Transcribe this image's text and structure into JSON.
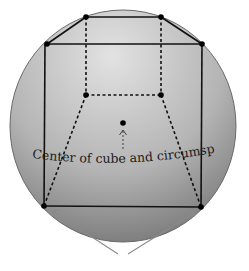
{
  "figure": {
    "label": "Center of cube and circumsphere",
    "colors": {
      "background": "#ffffff",
      "sphere_light": "#dcdcdc",
      "sphere_dark": "#7a7a7a",
      "sphere_outline": "#6a6a6a",
      "edge": "#111111",
      "vertex": "#000000",
      "pointer": "#8a8a8a"
    },
    "sphere": {
      "cx": 123,
      "cy": 126,
      "rx": 113,
      "ry": 116
    },
    "center_point": {
      "x": 123,
      "y": 123
    },
    "vertices": {
      "top_back_left": {
        "x": 86,
        "y": 17
      },
      "top_back_right": {
        "x": 161,
        "y": 17
      },
      "top_front_left": {
        "x": 47,
        "y": 44
      },
      "top_front_right": {
        "x": 202,
        "y": 44
      },
      "bottom_back_left": {
        "x": 86,
        "y": 95
      },
      "bottom_back_right": {
        "x": 161,
        "y": 95
      },
      "bottom_front_left": {
        "x": 44,
        "y": 206
      },
      "bottom_front_right": {
        "x": 201,
        "y": 207
      }
    }
  }
}
